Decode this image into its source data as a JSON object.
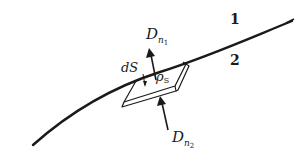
{
  "diagram": {
    "labels": {
      "region_1": "1",
      "region_2": "2",
      "dS": "dS",
      "rho_s_main": "ρ",
      "rho_s_sub": "S",
      "Dn1_main": "D",
      "Dn1_sub": "n",
      "Dn1_subsub": "1",
      "Dn2_main": "D",
      "Dn2_sub": "n",
      "Dn2_subsub": "2"
    },
    "colors": {
      "ink": "#1a1a1a",
      "background": "#ffffff"
    }
  }
}
